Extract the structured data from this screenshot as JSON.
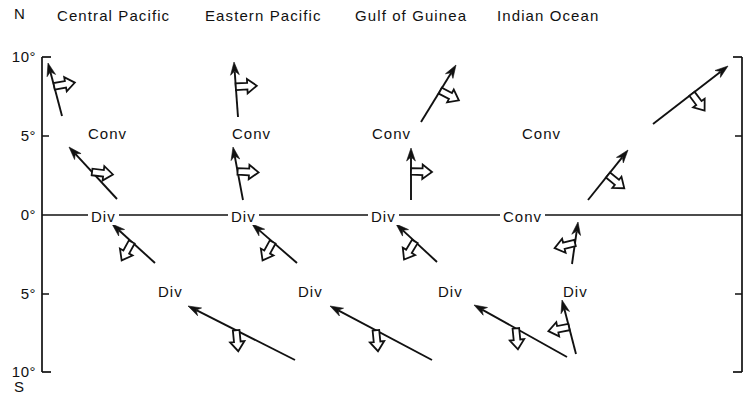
{
  "figure": {
    "type": "vector-diagram"
  },
  "columns": [
    {
      "id": "central-pacific",
      "header": "Central Pacific",
      "header_x": 57,
      "center_x": 140
    },
    {
      "id": "eastern-pacific",
      "header": "Eastern Pacific",
      "header_x": 205,
      "center_x": 285
    },
    {
      "id": "gulf-of-guinea",
      "header": "Gulf of Guinea",
      "header_x": 355,
      "center_x": 425
    },
    {
      "id": "indian-ocean",
      "header": "Indian Ocean",
      "header_x": 497,
      "center_x": 565
    }
  ],
  "axis": {
    "north_label": "N",
    "south_label": "S",
    "ticks": [
      {
        "label": "10°",
        "y": 57
      },
      {
        "label": "5°",
        "y": 136
      },
      {
        "label": "0°",
        "y": 215
      },
      {
        "label": "5°",
        "y": 294
      },
      {
        "label": "10°",
        "y": 372
      }
    ],
    "left_x": 42,
    "right_x": 742,
    "equator_y": 215
  },
  "zone_labels": {
    "north": [
      {
        "text": "Conv",
        "x": 85,
        "y": 125
      },
      {
        "text": "Conv",
        "x": 229,
        "y": 125
      },
      {
        "text": "Conv",
        "x": 369,
        "y": 125
      },
      {
        "text": "Conv",
        "x": 519,
        "y": 125
      }
    ],
    "equator": [
      {
        "text": "Div",
        "x": 88,
        "y": 208
      },
      {
        "text": "Div",
        "x": 228,
        "y": 208
      },
      {
        "text": "Div",
        "x": 368,
        "y": 208
      },
      {
        "text": "Conv",
        "x": 500,
        "y": 208
      }
    ],
    "south": [
      {
        "text": "Div",
        "x": 155,
        "y": 283
      },
      {
        "text": "Div",
        "x": 295,
        "y": 283
      },
      {
        "text": "Div",
        "x": 435,
        "y": 283
      },
      {
        "text": "Div",
        "x": 560,
        "y": 283
      }
    ]
  },
  "vectors": [
    {
      "id": "cp-north",
      "region": "central-pacific",
      "band": "north",
      "tail": [
        62,
        116
      ],
      "tip": [
        48,
        63
      ],
      "barb_t": 0.56,
      "barb_dir": [
        1,
        -0.18
      ]
    },
    {
      "id": "cp-mid",
      "region": "central-pacific",
      "band": "mid",
      "tail": [
        117,
        199
      ],
      "tip": [
        69,
        147
      ],
      "barb_t": 0.52,
      "barb_dir": [
        1,
        0.12
      ]
    },
    {
      "id": "cp-south",
      "region": "central-pacific",
      "band": "south",
      "tail": [
        155,
        263
      ],
      "tip": [
        112,
        224
      ],
      "barb_t": 0.54,
      "barb_dir": [
        -0.55,
        1
      ]
    },
    {
      "id": "cp-far",
      "region": "central-pacific",
      "band": "far-south",
      "tail": [
        295,
        360
      ],
      "tip": [
        188,
        306
      ],
      "barb_t": 0.55,
      "barb_dir": [
        0.1,
        1
      ]
    },
    {
      "id": "ep-north",
      "region": "eastern-pacific",
      "band": "north",
      "tail": [
        238,
        117
      ],
      "tip": [
        234,
        62
      ],
      "barb_t": 0.55,
      "barb_dir": [
        1,
        -0.05
      ]
    },
    {
      "id": "ep-mid",
      "region": "eastern-pacific",
      "band": "mid",
      "tail": [
        243,
        200
      ],
      "tip": [
        233,
        147
      ],
      "barb_t": 0.54,
      "barb_dir": [
        1,
        0.05
      ]
    },
    {
      "id": "ep-south",
      "region": "eastern-pacific",
      "band": "south",
      "tail": [
        297,
        263
      ],
      "tip": [
        252,
        224
      ],
      "barb_t": 0.54,
      "barb_dir": [
        -0.55,
        1
      ]
    },
    {
      "id": "ep-far",
      "region": "eastern-pacific",
      "band": "far-south",
      "tail": [
        432,
        360
      ],
      "tip": [
        330,
        306
      ],
      "barb_t": 0.55,
      "barb_dir": [
        0.1,
        1
      ]
    },
    {
      "id": "gg-north",
      "region": "gulf-of-guinea",
      "band": "north",
      "tail": [
        421,
        122
      ],
      "tip": [
        456,
        65
      ],
      "barb_t": 0.55,
      "barb_dir": [
        1,
        0.52
      ]
    },
    {
      "id": "gg-mid",
      "region": "gulf-of-guinea",
      "band": "mid",
      "tail": [
        411,
        200
      ],
      "tip": [
        411,
        148
      ],
      "barb_t": 0.55,
      "barb_dir": [
        1,
        0.03
      ]
    },
    {
      "id": "gg-south",
      "region": "gulf-of-guinea",
      "band": "south",
      "tail": [
        437,
        262
      ],
      "tip": [
        396,
        224
      ],
      "barb_t": 0.54,
      "barb_dir": [
        -0.6,
        1
      ]
    },
    {
      "id": "gg-far",
      "region": "gulf-of-guinea",
      "band": "far-south",
      "tail": [
        567,
        357
      ],
      "tip": [
        474,
        305
      ],
      "barb_t": 0.55,
      "barb_dir": [
        0.1,
        1
      ]
    },
    {
      "id": "io-north",
      "region": "indian-ocean",
      "band": "north",
      "tail": [
        653,
        124
      ],
      "tip": [
        728,
        66
      ],
      "barb_t": 0.52,
      "barb_dir": [
        0.75,
        1
      ]
    },
    {
      "id": "io-mid",
      "region": "indian-ocean",
      "band": "mid",
      "tail": [
        588,
        200
      ],
      "tip": [
        628,
        150
      ],
      "barb_t": 0.5,
      "barb_dir": [
        0.92,
        0.75
      ]
    },
    {
      "id": "io-south",
      "region": "indian-ocean",
      "band": "south",
      "tail": [
        572,
        264
      ],
      "tip": [
        578,
        222
      ],
      "barb_t": 0.5,
      "barb_dir": [
        -1,
        0.25
      ]
    },
    {
      "id": "io-far",
      "region": "indian-ocean",
      "band": "far-south",
      "tail": [
        576,
        354
      ],
      "tip": [
        562,
        300
      ],
      "barb_t": 0.5,
      "barb_dir": [
        -1,
        0.2
      ]
    }
  ],
  "style": {
    "line_color": "#111111",
    "hollow_fill": "#ffffff"
  }
}
